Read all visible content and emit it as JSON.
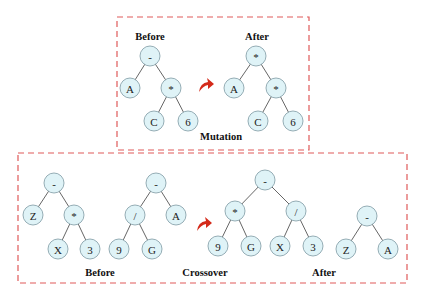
{
  "mutation": {
    "box": {
      "x": 117,
      "y": 17,
      "w": 192,
      "h": 133
    },
    "before_label": {
      "text": "Before",
      "x": 150,
      "y": 40
    },
    "after_label": {
      "text": "After",
      "x": 257,
      "y": 40
    },
    "caption": {
      "text": "Mutation",
      "x": 221,
      "y": 140
    },
    "arrow": {
      "x": 206,
      "y": 86
    },
    "before_tree": {
      "nodes": [
        {
          "id": "m_b_root",
          "label": "-",
          "x": 150,
          "y": 56
        },
        {
          "id": "m_b_a",
          "label": "A",
          "x": 130,
          "y": 88
        },
        {
          "id": "m_b_mul",
          "label": "*",
          "x": 171,
          "y": 88
        },
        {
          "id": "m_b_c",
          "label": "C",
          "x": 154,
          "y": 121
        },
        {
          "id": "m_b_6",
          "label": "6",
          "x": 188,
          "y": 121
        }
      ],
      "edges": [
        [
          "m_b_root",
          "m_b_a"
        ],
        [
          "m_b_root",
          "m_b_mul"
        ],
        [
          "m_b_mul",
          "m_b_c"
        ],
        [
          "m_b_mul",
          "m_b_6"
        ]
      ]
    },
    "after_tree": {
      "nodes": [
        {
          "id": "m_a_root",
          "label": "*",
          "x": 256,
          "y": 56
        },
        {
          "id": "m_a_a",
          "label": "A",
          "x": 234,
          "y": 88
        },
        {
          "id": "m_a_mul",
          "label": "*",
          "x": 276,
          "y": 88
        },
        {
          "id": "m_a_c",
          "label": "C",
          "x": 258,
          "y": 121
        },
        {
          "id": "m_a_6",
          "label": "6",
          "x": 293,
          "y": 121
        }
      ],
      "edges": [
        [
          "m_a_root",
          "m_a_a"
        ],
        [
          "m_a_root",
          "m_a_mul"
        ],
        [
          "m_a_mul",
          "m_a_c"
        ],
        [
          "m_a_mul",
          "m_a_6"
        ]
      ]
    }
  },
  "crossover": {
    "box": {
      "x": 18,
      "y": 153,
      "w": 389,
      "h": 130
    },
    "before_label": {
      "text": "Before",
      "x": 100,
      "y": 276
    },
    "caption": {
      "text": "Crossover",
      "x": 205,
      "y": 276
    },
    "after_label": {
      "text": "After",
      "x": 324,
      "y": 276
    },
    "arrow": {
      "x": 204,
      "y": 225
    },
    "parent1": {
      "nodes": [
        {
          "id": "p1_root",
          "label": "-",
          "x": 54,
          "y": 183
        },
        {
          "id": "p1_z",
          "label": "Z",
          "x": 33,
          "y": 215
        },
        {
          "id": "p1_mul",
          "label": "*",
          "x": 74,
          "y": 215
        },
        {
          "id": "p1_x",
          "label": "X",
          "x": 58,
          "y": 249
        },
        {
          "id": "p1_3",
          "label": "3",
          "x": 90,
          "y": 249
        }
      ],
      "edges": [
        [
          "p1_root",
          "p1_z"
        ],
        [
          "p1_root",
          "p1_mul"
        ],
        [
          "p1_mul",
          "p1_x"
        ],
        [
          "p1_mul",
          "p1_3"
        ]
      ]
    },
    "parent2": {
      "nodes": [
        {
          "id": "p2_root",
          "label": "-",
          "x": 156,
          "y": 183
        },
        {
          "id": "p2_div",
          "label": "/",
          "x": 135,
          "y": 215
        },
        {
          "id": "p2_a",
          "label": "A",
          "x": 176,
          "y": 215
        },
        {
          "id": "p2_9",
          "label": "9",
          "x": 119,
          "y": 249
        },
        {
          "id": "p2_g",
          "label": "G",
          "x": 152,
          "y": 249
        }
      ],
      "edges": [
        [
          "p2_root",
          "p2_div"
        ],
        [
          "p2_root",
          "p2_a"
        ],
        [
          "p2_div",
          "p2_9"
        ],
        [
          "p2_div",
          "p2_g"
        ]
      ]
    },
    "child1": {
      "nodes": [
        {
          "id": "c1_root",
          "label": "-",
          "x": 265,
          "y": 180
        },
        {
          "id": "c1_mul",
          "label": "*",
          "x": 235,
          "y": 211
        },
        {
          "id": "c1_div",
          "label": "/",
          "x": 296,
          "y": 211
        },
        {
          "id": "c1_9",
          "label": "9",
          "x": 218,
          "y": 246
        },
        {
          "id": "c1_g",
          "label": "G",
          "x": 251,
          "y": 246
        },
        {
          "id": "c1_x",
          "label": "X",
          "x": 280,
          "y": 246
        },
        {
          "id": "c1_3",
          "label": "3",
          "x": 313,
          "y": 246
        }
      ],
      "edges": [
        [
          "c1_root",
          "c1_mul"
        ],
        [
          "c1_root",
          "c1_div"
        ],
        [
          "c1_mul",
          "c1_9"
        ],
        [
          "c1_mul",
          "c1_g"
        ],
        [
          "c1_div",
          "c1_x"
        ],
        [
          "c1_div",
          "c1_3"
        ]
      ]
    },
    "child2": {
      "nodes": [
        {
          "id": "c2_root",
          "label": "-",
          "x": 367,
          "y": 216
        },
        {
          "id": "c2_z",
          "label": "Z",
          "x": 346,
          "y": 249
        },
        {
          "id": "c2_a",
          "label": "A",
          "x": 388,
          "y": 249
        }
      ],
      "edges": [
        [
          "c2_root",
          "c2_z"
        ],
        [
          "c2_root",
          "c2_a"
        ]
      ]
    }
  },
  "style": {
    "box_color": "#e05a5a",
    "node_fill": "#dff3f7",
    "node_stroke": "#8aa4ad",
    "arrow_color": "#d42a1a",
    "node_radius": 10
  }
}
